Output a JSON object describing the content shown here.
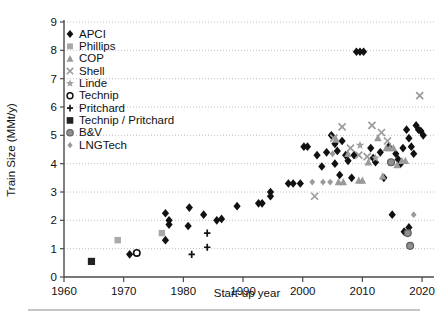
{
  "chart_data": {
    "type": "scatter",
    "title": "",
    "xlabel": "Start-up year",
    "ylabel": "Train Size (MMt/y)",
    "xlim": [
      1960,
      2022
    ],
    "ylim": [
      0,
      9
    ],
    "xticks": [
      1960,
      1970,
      1980,
      1990,
      2000,
      2010,
      2020
    ],
    "yticks": [
      0,
      1,
      2,
      3,
      4,
      5,
      6,
      7,
      8,
      9
    ],
    "grid": "horizontal-dotted",
    "legend_position": "upper-left-inside",
    "series": [
      {
        "name": "APCI",
        "marker": "diamond",
        "color": "#111111",
        "points": [
          [
            1971.0,
            0.8
          ],
          [
            1977.0,
            1.3
          ],
          [
            1977.0,
            2.25
          ],
          [
            1977.6,
            2.0
          ],
          [
            1977.6,
            1.85
          ],
          [
            1980.8,
            1.8
          ],
          [
            1981.0,
            2.45
          ],
          [
            1983.4,
            2.2
          ],
          [
            1985.6,
            2.0
          ],
          [
            1986.4,
            2.05
          ],
          [
            1989.0,
            2.5
          ],
          [
            1992.6,
            2.6
          ],
          [
            1993.2,
            2.6
          ],
          [
            1994.6,
            3.0
          ],
          [
            1994.6,
            2.85
          ],
          [
            1997.6,
            3.3
          ],
          [
            1998.4,
            3.3
          ],
          [
            1999.6,
            3.3
          ],
          [
            2000.2,
            4.6
          ],
          [
            2000.8,
            4.6
          ],
          [
            2002.4,
            4.3
          ],
          [
            2003.2,
            3.9
          ],
          [
            2004.0,
            4.4
          ],
          [
            2004.8,
            5.0
          ],
          [
            2005.4,
            4.7
          ],
          [
            2005.4,
            4.0
          ],
          [
            2005.8,
            4.45
          ],
          [
            2006.2,
            3.6
          ],
          [
            2006.6,
            4.8
          ],
          [
            2007.2,
            4.3
          ],
          [
            2007.6,
            4.1
          ],
          [
            2008.2,
            3.5
          ],
          [
            2008.6,
            4.3
          ],
          [
            2009.0,
            7.95
          ],
          [
            2009.6,
            7.95
          ],
          [
            2010.2,
            7.95
          ],
          [
            2011.4,
            4.55
          ],
          [
            2011.8,
            4.2
          ],
          [
            2012.2,
            4.05
          ],
          [
            2013.0,
            4.4
          ],
          [
            2013.6,
            3.5
          ],
          [
            2014.4,
            4.6
          ],
          [
            2015.0,
            2.2
          ],
          [
            2015.6,
            4.35
          ],
          [
            2016.0,
            4.15
          ],
          [
            2016.4,
            4.0
          ],
          [
            2016.8,
            4.55
          ],
          [
            2017.0,
            1.6
          ],
          [
            2017.4,
            5.2
          ],
          [
            2017.8,
            4.9
          ],
          [
            2018.2,
            4.6
          ],
          [
            2018.6,
            4.35
          ],
          [
            2019.0,
            5.35
          ],
          [
            2019.4,
            5.2
          ],
          [
            2019.8,
            5.15
          ],
          [
            2020.2,
            5.0
          ],
          [
            2017.8,
            1.75
          ]
        ]
      },
      {
        "name": "Phillips",
        "marker": "square",
        "color": "#a8a8a8",
        "points": [
          [
            1969.0,
            1.3
          ],
          [
            1976.4,
            1.55
          ]
        ]
      },
      {
        "name": "COP",
        "marker": "triangle",
        "color": "#9a9a9a",
        "points": [
          [
            2005.6,
            4.85
          ],
          [
            2006.0,
            3.35
          ],
          [
            2006.8,
            3.35
          ],
          [
            2007.6,
            4.35
          ],
          [
            2009.4,
            3.4
          ],
          [
            2010.0,
            3.4
          ],
          [
            2011.0,
            4.05
          ],
          [
            2012.6,
            4.9
          ],
          [
            2013.4,
            3.55
          ],
          [
            2014.0,
            4.55
          ],
          [
            2014.6,
            4.55
          ],
          [
            2015.2,
            4.55
          ],
          [
            2015.8,
            3.95
          ],
          [
            2016.6,
            4.1
          ],
          [
            2017.2,
            4.1
          ]
        ]
      },
      {
        "name": "Shell",
        "marker": "cross-x",
        "color": "#9a9a9a",
        "points": [
          [
            2002.0,
            2.85
          ],
          [
            2005.2,
            4.9
          ],
          [
            2006.6,
            5.3
          ],
          [
            2008.0,
            4.55
          ],
          [
            2009.4,
            4.3
          ],
          [
            2010.8,
            4.25
          ],
          [
            2011.6,
            5.35
          ],
          [
            2013.2,
            5.1
          ],
          [
            2014.2,
            4.8
          ],
          [
            2019.6,
            6.4
          ]
        ]
      },
      {
        "name": "Linde",
        "marker": "star",
        "color": "#a0a0a0",
        "points": [
          [
            2009.6,
            4.65
          ],
          [
            2012.2,
            4.2
          ]
        ]
      },
      {
        "name": "Technip",
        "marker": "open-circle",
        "color": "#111111",
        "points": [
          [
            1972.2,
            0.85
          ]
        ]
      },
      {
        "name": "Pritchard",
        "marker": "plus",
        "color": "#111111",
        "points": [
          [
            1981.4,
            0.8
          ],
          [
            1984.0,
            1.55
          ],
          [
            1984.0,
            1.05
          ]
        ]
      },
      {
        "name": "Technip / Pritchard",
        "marker": "filled-square",
        "color": "#222222",
        "points": [
          [
            1964.6,
            0.55
          ]
        ]
      },
      {
        "name": "B&V",
        "marker": "circle",
        "color": "#8f8f8f",
        "points": [
          [
            2017.6,
            1.55
          ],
          [
            2018.0,
            1.1
          ],
          [
            2014.8,
            4.05
          ]
        ]
      },
      {
        "name": "LNGTech",
        "marker": "small-diamond",
        "color": "#9a9a9a",
        "points": [
          [
            2001.6,
            3.35
          ],
          [
            2003.4,
            3.35
          ],
          [
            2004.6,
            3.35
          ],
          [
            2005.0,
            4.35
          ],
          [
            2018.6,
            2.2
          ]
        ]
      }
    ]
  },
  "legend": {
    "entries": [
      {
        "label": "APCI",
        "marker": "diamond",
        "color": "#111111"
      },
      {
        "label": "Phillips",
        "marker": "square",
        "color": "#a8a8a8"
      },
      {
        "label": "COP",
        "marker": "triangle",
        "color": "#9a9a9a"
      },
      {
        "label": "Shell",
        "marker": "cross-x",
        "color": "#9a9a9a"
      },
      {
        "label": "Linde",
        "marker": "star",
        "color": "#a0a0a0"
      },
      {
        "label": "Technip",
        "marker": "open-circle",
        "color": "#111111"
      },
      {
        "label": "Pritchard",
        "marker": "plus",
        "color": "#111111"
      },
      {
        "label": "Technip / Pritchard",
        "marker": "filled-square",
        "color": "#222222"
      },
      {
        "label": "B&V",
        "marker": "circle",
        "color": "#8f8f8f"
      },
      {
        "label": "LNGTech",
        "marker": "small-diamond",
        "color": "#9a9a9a"
      }
    ]
  }
}
